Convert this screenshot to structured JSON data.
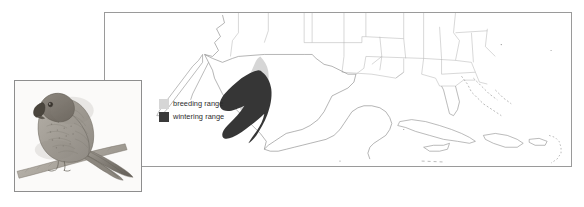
{
  "figure": {
    "type": "range-distribution-map",
    "background_color": "#ffffff",
    "panels": [
      {
        "name": "map-panel",
        "x": 104,
        "y": 12,
        "width": 468,
        "height": 155,
        "border_color": "#9a9a9a"
      },
      {
        "name": "bird-illustration-panel",
        "x": 14,
        "y": 80,
        "width": 128,
        "height": 112,
        "border_color": "#8e8e8e"
      }
    ]
  },
  "legend": {
    "title": "",
    "items": [
      {
        "label": "breeding range",
        "color": "#d6d6d6",
        "swatch_name": "breeding-range-swatch"
      },
      {
        "label": "wintering range",
        "color": "#3a3a3a",
        "swatch_name": "wintering-range-swatch"
      }
    ]
  },
  "map": {
    "region": "North America, Mexico, Central America and the Caribbean",
    "outline_color": "#8c8c8c",
    "coastline_color": "#7d7d7d",
    "state_border_color": "#a8a8a8",
    "ranges": [
      {
        "name": "breeding-range",
        "label": "breeding range",
        "fill": "#d6d6d6",
        "location": "Sierra Madre Occidental, northwestern Mexico"
      },
      {
        "name": "wintering-range",
        "label": "wintering range",
        "fill": "#363636",
        "location": "western and central Mexico, extending south along the Sierra Madre"
      }
    ]
  },
  "illustration": {
    "subject": "parrot perched on a branch",
    "medium": "pencil drawing",
    "tone_color": "#9a958e"
  }
}
